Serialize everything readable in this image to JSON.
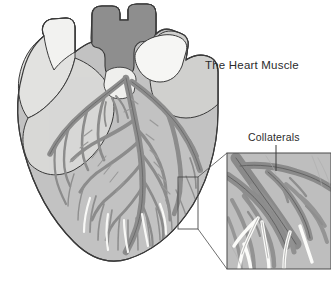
{
  "figure": {
    "kind": "anatomical-illustration",
    "background_color": "#ffffff"
  },
  "labels": {
    "title": "The Heart Muscle",
    "callout": "Collaterals"
  },
  "icons": {
    "leader_line": "leader-line",
    "callout_box": "callout-selection-box",
    "magnifier_frame": "magnified-inset-frame"
  },
  "palette": {
    "outline": "#3a3a3a",
    "myocardium_light": "#c9c9c9",
    "myocardium_mid": "#b8b8b8",
    "atrium_pale": "#d6d6d6",
    "vessel_white": "#f2f2f0",
    "great_vessel_dark": "#8a8a8a",
    "artery_gray": "#9a9a9a",
    "artery_dark": "#7d7d7d",
    "inset_background": "#bdbdbd",
    "text": "#2b2b2b"
  },
  "regions": [
    {
      "name": "superior-vena-cava",
      "fill": "#ececea"
    },
    {
      "name": "aorta",
      "fill": "#8a8a8a"
    },
    {
      "name": "pulmonary-artery",
      "fill": "#8a8a8a"
    },
    {
      "name": "pulmonary-veins",
      "fill": "#f4f4f2"
    },
    {
      "name": "right-atrium",
      "fill": "#d2d2d2"
    },
    {
      "name": "left-atrial-appendage",
      "fill": "#dcdcdc"
    },
    {
      "name": "right-ventricle",
      "fill": "#c4c4c4"
    },
    {
      "name": "left-ventricle",
      "fill": "#c0c0c0"
    }
  ],
  "inset": {
    "name": "collaterals-magnified-view",
    "frame": {
      "x": 226,
      "y": 152,
      "width": 105,
      "height": 118
    },
    "source_box": {
      "x": 178,
      "y": 177,
      "width": 20,
      "height": 52
    }
  }
}
